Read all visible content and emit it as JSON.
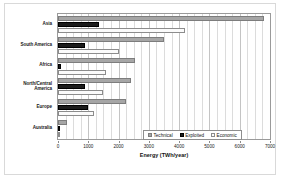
{
  "chart_data": {
    "type": "bar",
    "orientation": "horizontal",
    "title": "",
    "xlabel": "Energy (TWh/year)",
    "ylabel": "",
    "xlim": [
      0,
      7000
    ],
    "xticks": [
      0,
      1000,
      2000,
      3000,
      4000,
      5000,
      6000,
      7000
    ],
    "xtick_labels": [
      "0",
      "1000",
      "2000",
      "3000",
      "4000",
      "5000",
      "6000",
      "7000"
    ],
    "grid": true,
    "grid_axis": "x",
    "legend_position": "inside-bottom-right",
    "categories": [
      "Asia",
      "South America",
      "Africa",
      "North/Central America",
      "Europe",
      "Australia"
    ],
    "series": [
      {
        "name": "Technical",
        "color": "#a6a6a6",
        "values": [
          6800,
          3500,
          2550,
          2400,
          2250,
          300
        ]
      },
      {
        "name": "Exploited",
        "color": "#1c1c1c",
        "values": [
          1350,
          900,
          100,
          900,
          1000,
          40
        ]
      },
      {
        "name": "Economic",
        "color": "#fbfbfb",
        "values": [
          4200,
          2000,
          1600,
          1500,
          1200,
          60
        ]
      }
    ]
  },
  "legend": {
    "items": [
      {
        "label": "Technical",
        "swatch": "technical"
      },
      {
        "label": "Exploited",
        "swatch": "exploited"
      },
      {
        "label": "Economic",
        "swatch": "economic"
      }
    ]
  },
  "colors": {
    "technical": "#a6a6a6",
    "exploited": "#1c1c1c",
    "economic": "#fbfbfb",
    "axis": "#9a9a9a",
    "grid": "#dcdcdc",
    "text": "#1a1a1a",
    "background": "#ffffff"
  }
}
